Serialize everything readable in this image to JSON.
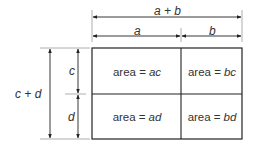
{
  "diagram": {
    "type": "area-model",
    "top_dimensions": {
      "total": "a + b",
      "segments": [
        "a",
        "b"
      ]
    },
    "left_dimensions": {
      "total": "c + d",
      "segments": [
        "c",
        "d"
      ]
    },
    "cells": [
      {
        "prefix": "area =",
        "var": "ac"
      },
      {
        "prefix": "area =",
        "var": "bc"
      },
      {
        "prefix": "area =",
        "var": "ad"
      },
      {
        "prefix": "area =",
        "var": "bd"
      }
    ],
    "colors": {
      "line": "#222222",
      "guide": "#b5b5b5",
      "background": "#ffffff"
    }
  }
}
